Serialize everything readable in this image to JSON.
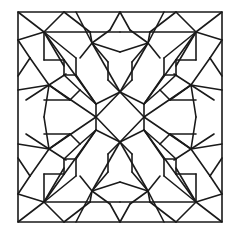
{
  "figure": {
    "stroke_color": "#1a1a1a",
    "background_color": "#ffffff",
    "stroke_width": 1.6,
    "frame": {
      "x": 18,
      "y": 12,
      "w": 204,
      "h": 210
    },
    "center": {
      "x": 120,
      "y": 117
    },
    "central_diamond": [
      [
        120,
        92
      ],
      [
        144,
        117
      ],
      [
        120,
        142
      ],
      [
        96,
        117
      ]
    ],
    "quadrant_segments": [
      [
        [
          18,
          12
        ],
        [
          44,
          32
        ]
      ],
      [
        [
          44,
          32
        ],
        [
          64,
          12
        ]
      ],
      [
        [
          44,
          32
        ],
        [
          18,
          40
        ]
      ],
      [
        [
          44,
          32
        ],
        [
          90,
          32
        ]
      ],
      [
        [
          44,
          32
        ],
        [
          44,
          60
        ]
      ],
      [
        [
          44,
          32
        ],
        [
          76,
          58
        ]
      ],
      [
        [
          44,
          32
        ],
        [
          64,
          66
        ]
      ],
      [
        [
          44,
          32
        ],
        [
          96,
          104
        ]
      ],
      [
        [
          64,
          12
        ],
        [
          90,
          32
        ]
      ],
      [
        [
          90,
          32
        ],
        [
          92,
          43
        ]
      ],
      [
        [
          76,
          12
        ],
        [
          92,
          43
        ]
      ],
      [
        [
          92,
          43
        ],
        [
          110,
          30
        ]
      ],
      [
        [
          110,
          30
        ],
        [
          120,
          12
        ]
      ],
      [
        [
          92,
          43
        ],
        [
          120,
          52
        ]
      ],
      [
        [
          92,
          43
        ],
        [
          108,
          62
        ]
      ],
      [
        [
          92,
          43
        ],
        [
          80,
          58
        ]
      ],
      [
        [
          92,
          43
        ],
        [
          120,
          92
        ]
      ],
      [
        [
          90,
          32
        ],
        [
          120,
          32
        ]
      ],
      [
        [
          18,
          40
        ],
        [
          30,
          58
        ]
      ],
      [
        [
          30,
          58
        ],
        [
          18,
          76
        ]
      ],
      [
        [
          44,
          60
        ],
        [
          64,
          60
        ]
      ],
      [
        [
          30,
          58
        ],
        [
          49,
          85
        ]
      ],
      [
        [
          18,
          90
        ],
        [
          49,
          85
        ]
      ],
      [
        [
          49,
          85
        ],
        [
          26,
          100
        ]
      ],
      [
        [
          49,
          85
        ],
        [
          44,
          117
        ]
      ],
      [
        [
          49,
          85
        ],
        [
          70,
          100
        ]
      ],
      [
        [
          49,
          85
        ],
        [
          66,
          74
        ]
      ],
      [
        [
          49,
          85
        ],
        [
          96,
          117
        ]
      ],
      [
        [
          64,
          60
        ],
        [
          64,
          75
        ]
      ],
      [
        [
          64,
          75
        ],
        [
          76,
          75
        ]
      ],
      [
        [
          76,
          58
        ],
        [
          76,
          75
        ]
      ],
      [
        [
          76,
          75
        ],
        [
          96,
          104
        ]
      ],
      [
        [
          64,
          75
        ],
        [
          80,
          90
        ]
      ],
      [
        [
          80,
          90
        ],
        [
          96,
          104
        ]
      ],
      [
        [
          96,
          104
        ],
        [
          120,
          92
        ]
      ],
      [
        [
          96,
          104
        ],
        [
          96,
          117
        ]
      ],
      [
        [
          108,
          62
        ],
        [
          108,
          80
        ]
      ],
      [
        [
          108,
          80
        ],
        [
          120,
          92
        ]
      ],
      [
        [
          44,
          100
        ],
        [
          70,
          100
        ]
      ],
      [
        [
          70,
          100
        ],
        [
          80,
          90
        ]
      ]
    ],
    "symmetry": "4-fold mirror about vertical and horizontal center lines"
  }
}
